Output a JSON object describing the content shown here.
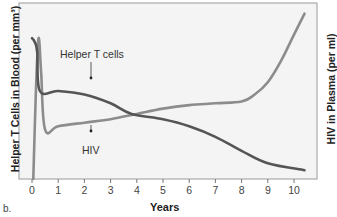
{
  "chart_data": {
    "type": "line",
    "title": "",
    "panel_label": "b.",
    "xlabel": "Years",
    "ylabel_left": "Helper T Cells in Blood (per mm³)",
    "ylabel_right": "HIV in Plasma (per ml)",
    "xlim": [
      -0.2,
      10.8
    ],
    "x_ticks": [
      "0",
      "1",
      "2",
      "3",
      "4",
      "5",
      "6",
      "7",
      "8",
      "9",
      "10"
    ],
    "grid": false,
    "legend": "none (inline annotations)",
    "annotations": [
      {
        "text": "Helper T cells",
        "points_to_x": 2.2
      },
      {
        "text": "HIV",
        "points_to_x": 2.2
      }
    ],
    "y_scale_note": "relative units (0 = bottom, 100 = top of plot); no numeric y ticks shown",
    "series": [
      {
        "name": "Helper T cells",
        "color": "#555555",
        "x": [
          0.0,
          0.1,
          0.2,
          0.3,
          1.0,
          2.0,
          3.0,
          3.8,
          5.0,
          6.0,
          7.0,
          8.0,
          9.0,
          10.4
        ],
        "values": [
          80,
          78,
          72,
          50,
          50,
          48,
          43,
          37,
          34,
          30,
          24,
          16,
          9,
          5
        ]
      },
      {
        "name": "HIV",
        "color": "#888888",
        "x": [
          0.05,
          0.15,
          0.25,
          0.35,
          0.5,
          1.0,
          2.0,
          3.0,
          4.0,
          5.0,
          6.0,
          7.0,
          8.0,
          8.5,
          9.0,
          9.5,
          10.0,
          10.4
        ],
        "values": [
          0,
          50,
          80,
          60,
          28,
          30,
          32,
          34,
          37,
          40,
          42,
          43,
          44,
          48,
          55,
          67,
          82,
          94
        ]
      }
    ]
  },
  "figure": {
    "panel_label": "b.",
    "xlabel": "Years",
    "ylabel_left": "Helper T Cells in Blood (per mm³)",
    "ylabel_right": "HIV in Plasma (per ml)",
    "annotation_tcells": "Helper T cells",
    "annotation_hiv": "HIV",
    "ticks": [
      "0",
      "1",
      "2",
      "3",
      "4",
      "5",
      "6",
      "7",
      "8",
      "9",
      "10"
    ]
  }
}
